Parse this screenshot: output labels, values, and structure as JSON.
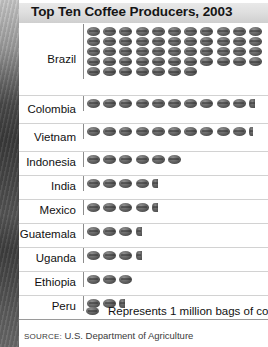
{
  "title": "Top Ten Coffee Producers, 2003",
  "legend": {
    "icon": "coffee-bean-icon",
    "text": "Represents 1 million bags of coffee"
  },
  "source": {
    "prefix": "SOURCE:",
    "text": " U.S. Department of Agriculture"
  },
  "colors": {
    "bean": "#4f4f4f",
    "title_bar": "#dedede",
    "rule": "#d2d2d2",
    "text": "#111111"
  },
  "chart_data": {
    "type": "bar",
    "title": "Top Ten Coffee Producers, 2003",
    "xlabel": "Millions of 60-kg bags of coffee",
    "ylabel": "Country",
    "unit": "1 million bags of coffee",
    "icon_unit_value": 1,
    "categories": [
      "Brazil",
      "Colombia",
      "Vietnam",
      "Indonesia",
      "India",
      "Mexico",
      "Guatemala",
      "Uganda",
      "Ethiopia",
      "Peru"
    ],
    "values": [
      51,
      10.5,
      10.25,
      6,
      4.5,
      4.5,
      3.5,
      3.5,
      3,
      2.5
    ],
    "icons": [
      {
        "country": "Brazil",
        "full": 51,
        "partial": 0
      },
      {
        "country": "Colombia",
        "full": 10,
        "partial": 0.5
      },
      {
        "country": "Vietnam",
        "full": 10,
        "partial": 0.25
      },
      {
        "country": "Indonesia",
        "full": 6,
        "partial": 0
      },
      {
        "country": "India",
        "full": 4,
        "partial": 0.5
      },
      {
        "country": "Mexico",
        "full": 4,
        "partial": 0.5
      },
      {
        "country": "Guatemala",
        "full": 3,
        "partial": 0.5
      },
      {
        "country": "Uganda",
        "full": 3,
        "partial": 0.5
      },
      {
        "country": "Ethiopia",
        "full": 3,
        "partial": 0
      },
      {
        "country": "Peru",
        "full": 2,
        "partial": 0.5
      }
    ],
    "grid": false,
    "legend_position": "bottom"
  }
}
